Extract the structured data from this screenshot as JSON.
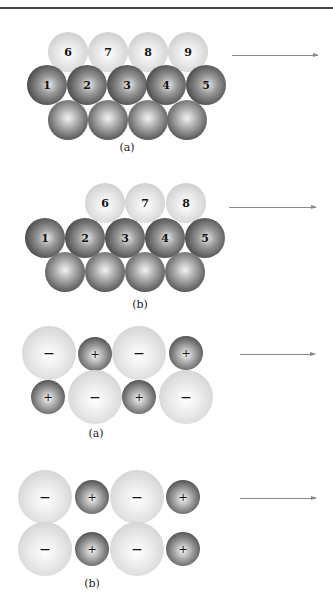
{
  "figures": [
    {
      "id": "fig1a",
      "label": "(a)",
      "label_pos": [
        127,
        141
      ],
      "arrow": {
        "x1": 232,
        "x2": 318,
        "y": 55
      },
      "spheres": [
        {
          "x": 68,
          "y": 52,
          "r": 20,
          "kind": "light",
          "text": "6"
        },
        {
          "x": 108,
          "y": 52,
          "r": 20,
          "kind": "light",
          "text": "7"
        },
        {
          "x": 148,
          "y": 52,
          "r": 20,
          "kind": "light",
          "text": "8"
        },
        {
          "x": 188,
          "y": 52,
          "r": 20,
          "kind": "light",
          "text": "9"
        },
        {
          "x": 47,
          "y": 85,
          "r": 20,
          "kind": "dark",
          "text": "1"
        },
        {
          "x": 87,
          "y": 85,
          "r": 20,
          "kind": "dark",
          "text": "2"
        },
        {
          "x": 127,
          "y": 85,
          "r": 20,
          "kind": "dark",
          "text": "3"
        },
        {
          "x": 166,
          "y": 85,
          "r": 20,
          "kind": "dark",
          "text": "4"
        },
        {
          "x": 206,
          "y": 85,
          "r": 20,
          "kind": "dark",
          "text": "5"
        },
        {
          "x": 68,
          "y": 120,
          "r": 20,
          "kind": "dark2",
          "text": ""
        },
        {
          "x": 108,
          "y": 120,
          "r": 20,
          "kind": "dark2",
          "text": ""
        },
        {
          "x": 148,
          "y": 120,
          "r": 20,
          "kind": "dark2",
          "text": ""
        },
        {
          "x": 187,
          "y": 120,
          "r": 20,
          "kind": "dark2",
          "text": ""
        }
      ]
    },
    {
      "id": "fig1b",
      "label": "(b)",
      "label_pos": [
        140,
        298
      ],
      "arrow": {
        "x1": 229,
        "x2": 316,
        "y": 207
      },
      "spheres": [
        {
          "x": 105,
          "y": 203,
          "r": 20,
          "kind": "light",
          "text": "6"
        },
        {
          "x": 145,
          "y": 203,
          "r": 20,
          "kind": "light",
          "text": "7"
        },
        {
          "x": 186,
          "y": 203,
          "r": 20,
          "kind": "light",
          "text": "8"
        },
        {
          "x": 45,
          "y": 238,
          "r": 20,
          "kind": "dark",
          "text": "1"
        },
        {
          "x": 85,
          "y": 238,
          "r": 20,
          "kind": "dark",
          "text": "2"
        },
        {
          "x": 125,
          "y": 238,
          "r": 20,
          "kind": "dark",
          "text": "3"
        },
        {
          "x": 165,
          "y": 238,
          "r": 20,
          "kind": "dark",
          "text": "4"
        },
        {
          "x": 205,
          "y": 238,
          "r": 20,
          "kind": "dark",
          "text": "5"
        },
        {
          "x": 65,
          "y": 272,
          "r": 20,
          "kind": "dark2",
          "text": ""
        },
        {
          "x": 105,
          "y": 272,
          "r": 20,
          "kind": "dark2",
          "text": ""
        },
        {
          "x": 145,
          "y": 272,
          "r": 20,
          "kind": "dark2",
          "text": ""
        },
        {
          "x": 185,
          "y": 272,
          "r": 20,
          "kind": "dark2",
          "text": ""
        }
      ]
    },
    {
      "id": "fig2a",
      "label": "(a)",
      "label_pos": [
        96,
        427
      ],
      "arrow": {
        "x1": 240,
        "x2": 315,
        "y": 354
      },
      "spheres": [
        {
          "x": 49,
          "y": 353,
          "r": 27,
          "kind": "ion-big",
          "text": "−"
        },
        {
          "x": 95,
          "y": 354,
          "r": 17,
          "kind": "ion-small",
          "text": "+"
        },
        {
          "x": 139,
          "y": 353,
          "r": 27,
          "kind": "ion-big",
          "text": "−"
        },
        {
          "x": 186,
          "y": 353,
          "r": 17,
          "kind": "ion-small",
          "text": "+"
        },
        {
          "x": 48,
          "y": 397,
          "r": 17,
          "kind": "ion-small",
          "text": "+"
        },
        {
          "x": 95,
          "y": 397,
          "r": 27,
          "kind": "ion-big",
          "text": "−"
        },
        {
          "x": 139,
          "y": 397,
          "r": 17,
          "kind": "ion-small",
          "text": "+"
        },
        {
          "x": 186,
          "y": 397,
          "r": 27,
          "kind": "ion-big",
          "text": "−"
        }
      ]
    },
    {
      "id": "fig2b",
      "label": "(b)",
      "label_pos": [
        92,
        577
      ],
      "arrow": {
        "x1": 240,
        "x2": 316,
        "y": 498
      },
      "spheres": [
        {
          "x": 45,
          "y": 497,
          "r": 27,
          "kind": "ion-big",
          "text": "−"
        },
        {
          "x": 92,
          "y": 497,
          "r": 17,
          "kind": "ion-small",
          "text": "+"
        },
        {
          "x": 137,
          "y": 497,
          "r": 27,
          "kind": "ion-big",
          "text": "−"
        },
        {
          "x": 183,
          "y": 497,
          "r": 17,
          "kind": "ion-small",
          "text": "+"
        },
        {
          "x": 45,
          "y": 549,
          "r": 27,
          "kind": "ion-big",
          "text": "−"
        },
        {
          "x": 92,
          "y": 549,
          "r": 17,
          "kind": "ion-small",
          "text": "+"
        },
        {
          "x": 137,
          "y": 549,
          "r": 27,
          "kind": "ion-big",
          "text": "−"
        },
        {
          "x": 183,
          "y": 549,
          "r": 17,
          "kind": "ion-small",
          "text": "+"
        }
      ]
    }
  ]
}
